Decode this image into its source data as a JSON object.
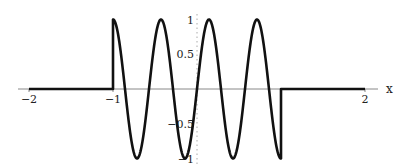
{
  "chart_data": {
    "type": "line",
    "title": "",
    "xlabel": "x",
    "ylabel": "",
    "xlim": [
      -2.2,
      2.1
    ],
    "ylim": [
      -1,
      1
    ],
    "grid": false,
    "legend": "none",
    "function_description": "f(x) = cos(3.5*pi*(x+1)) for -1 <= x <= 1, else 0",
    "pieces": [
      {
        "domain": [
          -2,
          -1
        ],
        "expr": "0"
      },
      {
        "domain": [
          -1,
          1
        ],
        "expr": "cos(3.5*pi*(x+1))"
      },
      {
        "domain": [
          1,
          2
        ],
        "expr": "0"
      }
    ],
    "x_ticks": [
      {
        "value": -2,
        "label": "−2"
      },
      {
        "value": -1,
        "label": "−1"
      },
      {
        "value": 2,
        "label": "2"
      }
    ],
    "y_ticks": [
      {
        "value": 1,
        "label": "1"
      },
      {
        "value": 0.5,
        "label": "0.5"
      },
      {
        "value": -0.5,
        "label": "−0.5"
      },
      {
        "value": -1,
        "label": "−1"
      }
    ],
    "colors": {
      "curve": "#111111",
      "axis": "#888888"
    }
  }
}
